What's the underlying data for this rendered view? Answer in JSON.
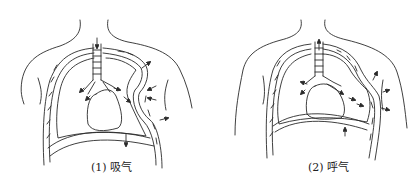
{
  "figure": {
    "panels": [
      {
        "id": "inhalation",
        "caption": "(1) 吸气",
        "icon": "thorax-inhalation-diagram"
      },
      {
        "id": "exhalation",
        "caption": "(2) 呼气",
        "icon": "thorax-exhalation-diagram"
      }
    ]
  },
  "colors": {
    "line": "#2a2a2a",
    "background": "#ffffff"
  }
}
